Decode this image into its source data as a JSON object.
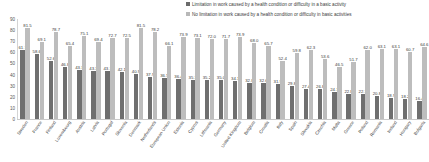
{
  "chart_data": {
    "type": "bar",
    "title": "",
    "subtitle": "",
    "xlabel": "",
    "ylabel": "",
    "ylim": [
      0,
      90
    ],
    "yticks": [
      "0",
      "10",
      "20",
      "30",
      "40",
      "50",
      "60",
      "70",
      "80",
      "90"
    ],
    "grid": false,
    "legend_position": "top-right",
    "colors": {
      "series_limitation": "#6f6f6f",
      "series_no_limitation": "#bdbdbd",
      "text": "#3a3a3a",
      "axis": "#c9c9c9",
      "background": "#ffffff"
    },
    "categories": [
      "Sweden",
      "France",
      "Finland",
      "Luxembourg",
      "Austria",
      "Latvia",
      "Portugal",
      "Slovenia",
      "Denmark",
      "Netherlands",
      "European Union",
      "Estonia",
      "Cyprus",
      "Lithuania",
      "Germany",
      "United Kingdom",
      "Belgium",
      "Croatia",
      "Italy",
      "Spain",
      "Slovakia",
      "Czechia",
      "Malta",
      "Greece",
      "Poland",
      "Romania",
      "Ireland",
      "Hungary",
      "Bulgaria"
    ],
    "series": [
      {
        "name": "Limitation in work caused by a health condition or difficulty in a basic activity",
        "color": "#6f6f6f",
        "values": [
          61.7,
          58.6,
          52.6,
          46.8,
          43.7,
          43.3,
          43.1,
          42.1,
          40.9,
          37.9,
          36.5,
          36.4,
          35.3,
          35.2,
          35.0,
          34.1,
          32.8,
          32.6,
          31.9,
          29.8,
          27.4,
          26.8,
          24.1,
          22.8,
          22.1,
          20.8,
          18.9,
          18.2,
          16.4
        ]
      },
      {
        "name": "No limitation in work caused by a health condition or difficulty in basic activities",
        "color": "#bdbdbd",
        "values": [
          81.5,
          69.1,
          78.7,
          65.4,
          75.1,
          69.4,
          72.7,
          72.5,
          81.5,
          78.2,
          66.1,
          73.9,
          73.1,
          72.0,
          71.7,
          73.9,
          68.0,
          65.7,
          52.4,
          59.8,
          62.3,
          53.6,
          46.5,
          51.7,
          62.0,
          63.1,
          63.1,
          60.7,
          64.6
        ]
      }
    ]
  },
  "legend": {
    "items": [
      {
        "label": "Limitation in work caused by a health condition or difficulty in a basic activity",
        "swatch": "dark-square-icon"
      },
      {
        "label": "No limitation in work caused by a health condition or difficulty in basic activities",
        "swatch": "light-square-icon"
      }
    ]
  }
}
